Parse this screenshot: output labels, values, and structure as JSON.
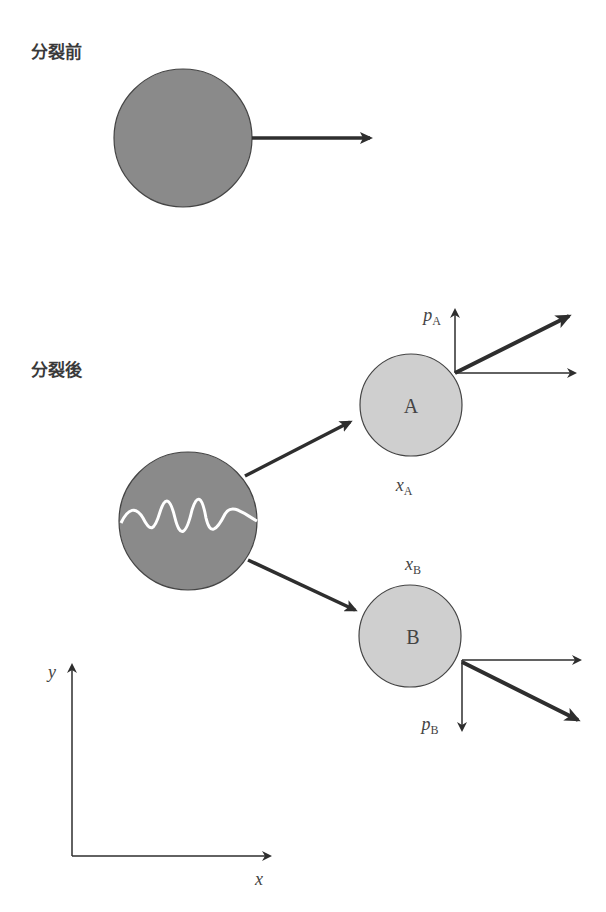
{
  "labels": {
    "before": "分裂前",
    "after": "分裂後",
    "particle_a": "A",
    "particle_b": "B",
    "x_a_main": "x",
    "x_a_sub": "A",
    "x_b_main": "x",
    "x_b_sub": "B",
    "p_a_main": "p",
    "p_a_sub": "A",
    "p_b_main": "p",
    "p_b_sub": "B",
    "axis_x": "x",
    "axis_y": "y"
  },
  "colors": {
    "parent_fill": "#8a8a8a",
    "fragment_fill": "#cfcfcf",
    "arrow": "#2e2e2e",
    "wave": "#ffffff"
  }
}
